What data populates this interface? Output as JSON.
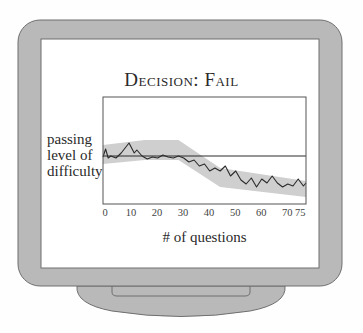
{
  "figure": {
    "title": "Decision: Fail",
    "y_label": "passing level of difficulty",
    "x_label": "# of questions"
  },
  "colors": {
    "background": "#fefefe",
    "bezel": "#b9b9b9",
    "bezel_stroke": "#6f6f6f",
    "screen": "#ffffff",
    "band": "#cfcfcf",
    "line": "#2b2b2b",
    "axis": "#555555"
  },
  "chart_data": {
    "type": "line",
    "title": "Decision: Fail",
    "xlabel": "# of questions",
    "ylabel": "passing level of difficulty",
    "xlim": [
      0,
      78
    ],
    "ylim": [
      0,
      107
    ],
    "x_ticks": [
      0,
      10,
      20,
      30,
      40,
      50,
      60,
      70,
      75
    ],
    "passing_level": 48,
    "grid": false,
    "legend": null,
    "series": [
      {
        "name": "estimated ability / difficulty",
        "x": [
          0,
          1,
          2,
          3,
          5,
          7,
          10,
          12,
          13,
          15,
          17,
          19,
          21,
          23,
          25,
          27,
          29,
          31,
          33,
          35,
          37,
          39,
          41,
          43,
          45,
          47,
          49,
          51,
          53,
          55,
          57,
          59,
          61,
          63,
          65,
          67,
          69,
          71,
          73,
          75,
          77,
          78
        ],
        "values": [
          47,
          55,
          46,
          48,
          46,
          51,
          61,
          51,
          54,
          48,
          45,
          47,
          46,
          49,
          47,
          46,
          48,
          46,
          42,
          44,
          38,
          40,
          33,
          36,
          33,
          38,
          28,
          33,
          24,
          20,
          26,
          17,
          25,
          21,
          28,
          21,
          17,
          20,
          18,
          25,
          18,
          21
        ]
      }
    ],
    "confidence_band": {
      "x": [
        0,
        16,
        29,
        45,
        78
      ],
      "upper": [
        59,
        64,
        64,
        36,
        23
      ],
      "lower": [
        40,
        44,
        44,
        17,
        7
      ]
    }
  }
}
